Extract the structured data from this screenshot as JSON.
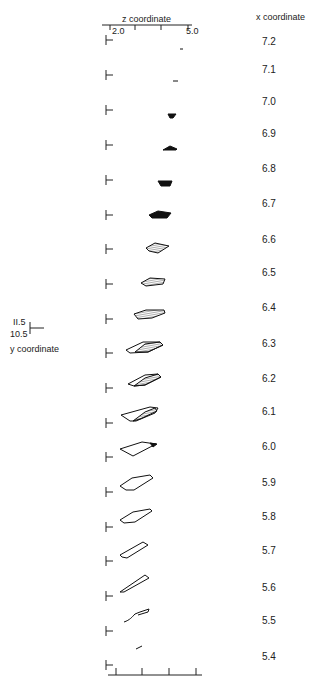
{
  "z_axis": {
    "title": "z coordinate",
    "min_label": "2.0",
    "max_label": "5.0"
  },
  "x_axis": {
    "title": "x coordinate"
  },
  "y_scale": {
    "top_label": "II.5",
    "bottom_label": "10.5",
    "title": "y coordinate"
  },
  "sections": [
    {
      "x": "7.2"
    },
    {
      "x": "7.1"
    },
    {
      "x": "7.0"
    },
    {
      "x": "6.9"
    },
    {
      "x": "6.8"
    },
    {
      "x": "6.7"
    },
    {
      "x": "6.6"
    },
    {
      "x": "6.5"
    },
    {
      "x": "6.4"
    },
    {
      "x": "6.3"
    },
    {
      "x": "6.2"
    },
    {
      "x": "6.1"
    },
    {
      "x": "6.0"
    },
    {
      "x": "5.9"
    },
    {
      "x": "5.8"
    },
    {
      "x": "5.7"
    },
    {
      "x": "5.6"
    },
    {
      "x": "5.5"
    },
    {
      "x": "5.4"
    }
  ]
}
